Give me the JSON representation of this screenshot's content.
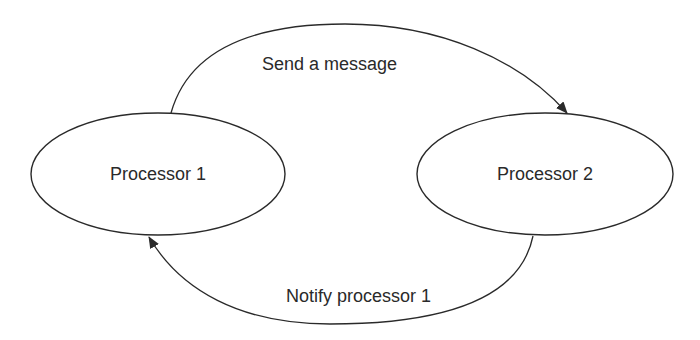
{
  "diagram": {
    "type": "state-message-flow",
    "colors": {
      "background": "#ffffff",
      "stroke": "#2a2a2a",
      "text": "#2a2a2a"
    },
    "nodes": [
      {
        "id": "p1",
        "label": "Processor 1",
        "shape": "ellipse"
      },
      {
        "id": "p2",
        "label": "Processor 2",
        "shape": "ellipse"
      }
    ],
    "edges": [
      {
        "from": "p1",
        "to": "p2",
        "label": "Send a message",
        "direction": "arrow-to-target",
        "route": "top-arc"
      },
      {
        "from": "p2",
        "to": "p1",
        "label": "Notify processor 1",
        "direction": "arrow-to-target",
        "route": "bottom-arc"
      }
    ]
  }
}
